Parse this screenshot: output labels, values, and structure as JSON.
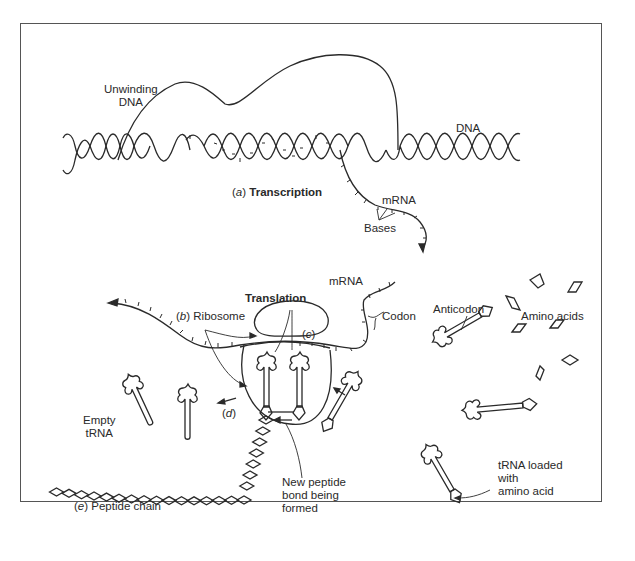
{
  "figure": {
    "labels": {
      "unwinding_dna": [
        "Unwinding",
        "DNA"
      ],
      "dna": "DNA",
      "transcription_prefix": "(a)",
      "transcription_letter": "a",
      "transcription": "Transcription",
      "mrna_top": "mRNA",
      "bases": "Bases",
      "mrna_mid": "mRNA",
      "translation": "Translation",
      "ribosome_letter": "b",
      "ribosome": "Ribosome",
      "c_letter": "c",
      "codon": "Codon",
      "anticodon": "Anticodon",
      "amino_acids": "Amino acids",
      "empty_trna": [
        "Empty",
        "tRNA"
      ],
      "d_letter": "d",
      "new_peptide_bond": [
        "New peptide",
        "bond being",
        "formed"
      ],
      "peptide_chain_letter": "e",
      "peptide_chain": "Peptide chain",
      "trna_loaded": [
        "tRNA loaded",
        "with",
        "amino acid"
      ]
    }
  }
}
